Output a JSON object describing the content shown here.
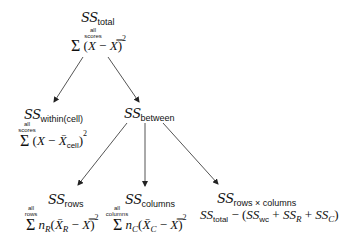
{
  "diagram": {
    "type": "tree",
    "nodes": {
      "total": {
        "ss_label": "SS",
        "sub": "total",
        "limits": [
          "all",
          "scores"
        ],
        "sigma": "Σ",
        "expr_open": "(",
        "expr_x": "X",
        "expr_minus": " − ",
        "expr_grand": "X̿",
        "expr_close": ")",
        "expr_pow": "2"
      },
      "within": {
        "ss_label": "SS",
        "sub": "within(cell)",
        "limits": [
          "all",
          "scores"
        ],
        "sigma": "Σ",
        "expr_open": "(",
        "expr_x": "X",
        "expr_minus": " − ",
        "expr_mean": "X̄",
        "expr_mean_sub": "cell",
        "expr_close": ")",
        "expr_pow": "2"
      },
      "between": {
        "ss_label": "SS",
        "sub": "between"
      },
      "rows": {
        "ss_label": "SS",
        "sub": "rows",
        "limits": [
          "all",
          "rows"
        ],
        "sigma": "Σ",
        "n": "n",
        "n_sub": "R",
        "mean": "X̄",
        "mean_sub": "R",
        "minus": " − ",
        "grand": "X̿",
        "pow": "2"
      },
      "columns": {
        "ss_label": "SS",
        "sub": "columns",
        "limits": [
          "all",
          "columns"
        ],
        "sigma": "Σ",
        "n": "n",
        "n_sub": "C",
        "mean": "X̄",
        "mean_sub": "C",
        "minus": " − ",
        "grand": "X̿",
        "pow": "2"
      },
      "interaction": {
        "ss_label": "SS",
        "sub": "rows × columns",
        "formula": {
          "ss1": "SS",
          "ss1_sub": "total",
          "minus_open": " − (",
          "ss2": "SS",
          "ss2_sub": "wc",
          "plus1": " + ",
          "ss3": "SS",
          "ss3_sub": "R",
          "plus2": " + ",
          "ss4": "SS",
          "ss4_sub": "C",
          "close": ")"
        }
      }
    },
    "edges": [
      {
        "from": "total",
        "to": "within"
      },
      {
        "from": "total",
        "to": "between"
      },
      {
        "from": "between",
        "to": "rows"
      },
      {
        "from": "between",
        "to": "columns"
      },
      {
        "from": "between",
        "to": "interaction"
      }
    ],
    "colors": {
      "text": "#111111",
      "arrow": "#555555",
      "background": "#ffffff"
    }
  }
}
